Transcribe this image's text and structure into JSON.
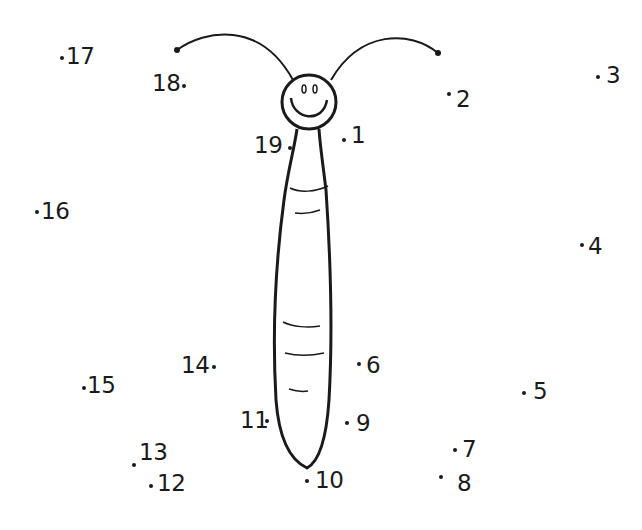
{
  "worksheet": {
    "type": "connect-the-dots",
    "subject": "butterfly body with antennae",
    "ink_color": "#1a1a1a",
    "background": "#ffffff",
    "dots": [
      {
        "n": "1",
        "label": "1",
        "dot": [
          344,
          140
        ],
        "text": [
          351,
          124
        ],
        "side": "right"
      },
      {
        "n": "2",
        "label": "2",
        "dot": [
          449,
          94
        ],
        "text": [
          456,
          88
        ],
        "side": "right"
      },
      {
        "n": "3",
        "label": "3",
        "dot": [
          598,
          77
        ],
        "text": [
          606,
          64
        ],
        "side": "right"
      },
      {
        "n": "4",
        "label": "4",
        "dot": [
          582,
          245
        ],
        "text": [
          588,
          235
        ],
        "side": "right"
      },
      {
        "n": "5",
        "label": "5",
        "dot": [
          524,
          393
        ],
        "text": [
          533,
          380
        ],
        "side": "right"
      },
      {
        "n": "6",
        "label": "6",
        "dot": [
          359,
          364
        ],
        "text": [
          366,
          354
        ],
        "side": "right"
      },
      {
        "n": "7",
        "label": "7",
        "dot": [
          455,
          450
        ],
        "text": [
          462,
          438
        ],
        "side": "right"
      },
      {
        "n": "8",
        "label": "8",
        "dot": [
          441,
          477
        ],
        "text": [
          457,
          472
        ],
        "side": "right"
      },
      {
        "n": "9",
        "label": "9",
        "dot": [
          347,
          423
        ],
        "text": [
          356,
          412
        ],
        "side": "right"
      },
      {
        "n": "10",
        "label": "10",
        "dot": [
          307,
          481
        ],
        "text": [
          315,
          469
        ],
        "side": "right"
      },
      {
        "n": "11",
        "label": "11",
        "dot": [
          267,
          421
        ],
        "text": [
          240,
          409
        ],
        "side": "left"
      },
      {
        "n": "12",
        "label": "12",
        "dot": [
          151,
          486
        ],
        "text": [
          157,
          472
        ],
        "side": "right"
      },
      {
        "n": "13",
        "label": "13",
        "dot": [
          134,
          465
        ],
        "text": [
          139,
          441
        ],
        "side": "right"
      },
      {
        "n": "14",
        "label": "14",
        "dot": [
          214,
          367
        ],
        "text": [
          181,
          354
        ],
        "side": "left"
      },
      {
        "n": "15",
        "label": "15",
        "dot": [
          84,
          388
        ],
        "text": [
          87,
          374
        ],
        "side": "right"
      },
      {
        "n": "16",
        "label": "16",
        "dot": [
          37,
          212
        ],
        "text": [
          41,
          200
        ],
        "side": "right"
      },
      {
        "n": "17",
        "label": "17",
        "dot": [
          62,
          58
        ],
        "text": [
          66,
          45
        ],
        "side": "right"
      },
      {
        "n": "18",
        "label": "18",
        "dot": [
          184,
          86
        ],
        "text": [
          152,
          72
        ],
        "side": "left"
      },
      {
        "n": "19",
        "label": "19",
        "dot": [
          290,
          148
        ],
        "text": [
          254,
          134
        ],
        "side": "left"
      }
    ]
  }
}
